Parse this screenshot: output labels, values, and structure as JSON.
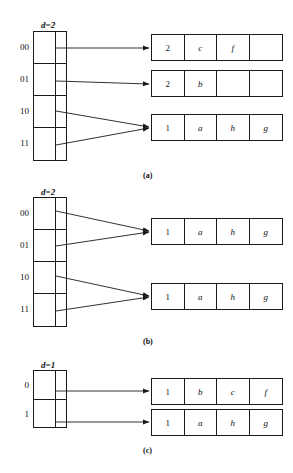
{
  "figure": {
    "background_color": "#ffffff",
    "line_color": "#1a1a1a"
  },
  "panels": [
    {
      "id": "a",
      "caption": "(a)",
      "directory": {
        "depth_label": "d=2",
        "entries": [
          "00",
          "01",
          "10",
          "11"
        ]
      },
      "buckets": [
        {
          "local_depth": "2",
          "keys": [
            "c",
            "f",
            ""
          ]
        },
        {
          "local_depth": "2",
          "keys": [
            "b",
            "",
            ""
          ]
        },
        {
          "local_depth": "1",
          "keys": [
            "a",
            "h",
            "g"
          ]
        }
      ],
      "pointers": [
        {
          "from_entry": "00",
          "to_bucket": 0
        },
        {
          "from_entry": "01",
          "to_bucket": 1
        },
        {
          "from_entry": "10",
          "to_bucket": 2
        },
        {
          "from_entry": "11",
          "to_bucket": 2
        }
      ]
    },
    {
      "id": "b",
      "caption": "(b)",
      "directory": {
        "depth_label": "d=2",
        "entries": [
          "00",
          "01",
          "10",
          "11"
        ]
      },
      "buckets": [
        {
          "local_depth": "1",
          "keys": [
            "a",
            "h",
            "g"
          ]
        },
        {
          "local_depth": "1",
          "keys": [
            "a",
            "h",
            "g"
          ]
        }
      ],
      "pointers": [
        {
          "from_entry": "00",
          "to_bucket": 0
        },
        {
          "from_entry": "01",
          "to_bucket": 0
        },
        {
          "from_entry": "10",
          "to_bucket": 1
        },
        {
          "from_entry": "11",
          "to_bucket": 1
        }
      ]
    },
    {
      "id": "c",
      "caption": "(c)",
      "directory": {
        "depth_label": "d=1",
        "entries": [
          "0",
          "1"
        ]
      },
      "buckets": [
        {
          "local_depth": "1",
          "keys": [
            "b",
            "c",
            "f"
          ]
        },
        {
          "local_depth": "1",
          "keys": [
            "a",
            "h",
            "g"
          ]
        }
      ],
      "pointers": [
        {
          "from_entry": "0",
          "to_bucket": 0
        },
        {
          "from_entry": "1",
          "to_bucket": 1
        }
      ]
    }
  ]
}
